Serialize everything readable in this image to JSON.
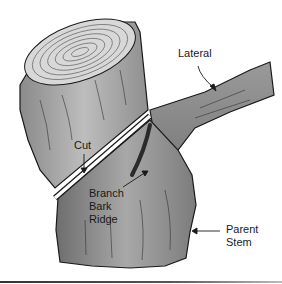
{
  "figure": {
    "labels": {
      "lateral": "Lateral",
      "cut": "Cut",
      "branch_bark_ridge_line1": "Branch",
      "branch_bark_ridge_line2": "Bark",
      "branch_bark_ridge_line3": "Ridge",
      "parent_stem_line1": "Parent",
      "parent_stem_line2": "Stem"
    },
    "colors": {
      "bark_light": "#bdbdbd",
      "bark_dark": "#6e6e6e",
      "ridge": "#2a2a2a",
      "outline": "#1a1a1a",
      "cut_line": "#ffffff"
    }
  }
}
